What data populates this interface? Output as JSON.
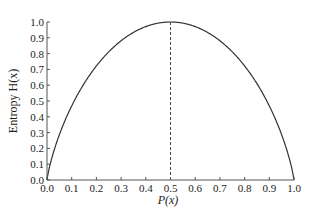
{
  "chart_data": {
    "type": "line",
    "title": "",
    "xlabel": "P(x)",
    "ylabel": "Entropy H(x)",
    "xlim": [
      0.0,
      1.0
    ],
    "ylim": [
      0.0,
      1.0
    ],
    "grid": false,
    "legend": null,
    "x_ticks": [
      "0.0",
      "0.1",
      "0.2",
      "0.3",
      "0.4",
      "0.5",
      "0.6",
      "0.7",
      "0.8",
      "0.9",
      "1.0"
    ],
    "y_ticks": [
      "0.0",
      "0.1",
      "0.2",
      "0.3",
      "0.4",
      "0.5",
      "0.6",
      "0.7",
      "0.8",
      "0.9",
      "1.0"
    ],
    "series": [
      {
        "name": "H(x) = -p log2 p - (1-p) log2 (1-p)",
        "style": "solid",
        "x": [
          0.0,
          0.05,
          0.1,
          0.15,
          0.2,
          0.25,
          0.3,
          0.35,
          0.4,
          0.45,
          0.5,
          0.55,
          0.6,
          0.65,
          0.7,
          0.75,
          0.8,
          0.85,
          0.9,
          0.95,
          1.0
        ],
        "y": [
          0.0,
          0.286,
          0.469,
          0.61,
          0.722,
          0.811,
          0.881,
          0.934,
          0.971,
          0.993,
          1.0,
          0.993,
          0.971,
          0.934,
          0.881,
          0.811,
          0.722,
          0.61,
          0.469,
          0.286,
          0.0
        ]
      }
    ],
    "annotations": [
      {
        "type": "vertical-dashed-line",
        "x": 0.5,
        "y_from": 0.0,
        "y_to": 1.0
      }
    ],
    "colors": {
      "curve": "#333333",
      "axis": "#555555",
      "dashed": "#444444"
    }
  }
}
